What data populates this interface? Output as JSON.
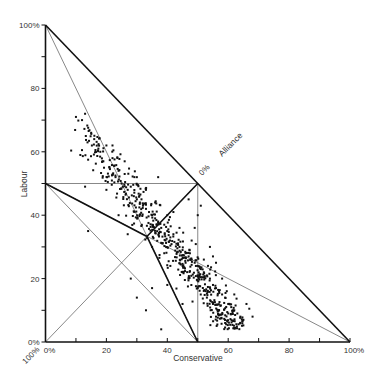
{
  "chart_data": {
    "type": "scatter",
    "subtype": "ternary-in-right-triangle",
    "title": "",
    "xlabel": "Conservative",
    "ylabel": "Labour",
    "third_axis_label": "Alliance",
    "third_axis_zero_label": "0%",
    "xlim": [
      0,
      100
    ],
    "ylim": [
      0,
      100
    ],
    "x_ticks": [
      0,
      10,
      20,
      30,
      40,
      50,
      60,
      70,
      80,
      90,
      100
    ],
    "x_tick_labels": [
      {
        "value": 0,
        "label": "0%"
      },
      {
        "value": 20,
        "label": "20"
      },
      {
        "value": 40,
        "label": "40"
      },
      {
        "value": 60,
        "label": "60"
      },
      {
        "value": 80,
        "label": "80"
      },
      {
        "value": 100,
        "label": "100%"
      }
    ],
    "y_ticks": [
      0,
      10,
      20,
      30,
      40,
      50,
      60,
      70,
      80,
      90,
      100
    ],
    "y_tick_labels": [
      {
        "value": 0,
        "label": "0%"
      },
      {
        "value": 20,
        "label": "20"
      },
      {
        "value": 40,
        "label": "40"
      },
      {
        "value": 60,
        "label": "60"
      },
      {
        "value": 80,
        "label": "80"
      },
      {
        "value": 100,
        "label": "100%"
      }
    ],
    "corner_label_alliance_100": "100%",
    "grid": false,
    "legend": "none",
    "thick_lines": [
      {
        "from": [
          0,
          100
        ],
        "to": [
          100,
          0
        ]
      },
      {
        "from": [
          0,
          50
        ],
        "to": [
          33.3,
          33.3
        ]
      },
      {
        "from": [
          50,
          0
        ],
        "to": [
          33.3,
          33.3
        ]
      },
      {
        "from": [
          50,
          50
        ],
        "to": [
          33.3,
          33.3
        ]
      }
    ],
    "thin_lines": [
      {
        "from": [
          0,
          100
        ],
        "to": [
          50,
          0
        ]
      },
      {
        "from": [
          100,
          0
        ],
        "to": [
          0,
          50
        ]
      },
      {
        "from": [
          0,
          0
        ],
        "to": [
          50,
          50
        ]
      },
      {
        "from": [
          0,
          50
        ],
        "to": [
          50,
          0
        ]
      },
      {
        "from": [
          0,
          50
        ],
        "to": [
          50,
          50
        ]
      },
      {
        "from": [
          50,
          0
        ],
        "to": [
          50,
          50
        ]
      }
    ],
    "series": [
      {
        "name": "Constituencies",
        "description": "Dense band of points running from about (10,72) down to (65,6), concentrated along the line Labour ≈ 80 − 1.2·Conservative",
        "points": [
          [
            10,
            71
          ],
          [
            12,
            70
          ],
          [
            13,
            72
          ],
          [
            15,
            66
          ],
          [
            16,
            64
          ],
          [
            18,
            60
          ],
          [
            19,
            57
          ],
          [
            20,
            62
          ],
          [
            21,
            55
          ],
          [
            22,
            58
          ],
          [
            23,
            52
          ],
          [
            24,
            54
          ],
          [
            25,
            50
          ],
          [
            26,
            53
          ],
          [
            27,
            48
          ],
          [
            28,
            49
          ],
          [
            29,
            46
          ],
          [
            30,
            45
          ],
          [
            31,
            44
          ],
          [
            32,
            43
          ],
          [
            33,
            42
          ],
          [
            34,
            41
          ],
          [
            35,
            40
          ],
          [
            36,
            39
          ],
          [
            37,
            38
          ],
          [
            38,
            36
          ],
          [
            39,
            37
          ],
          [
            40,
            35
          ],
          [
            41,
            33
          ],
          [
            42,
            34
          ],
          [
            43,
            31
          ],
          [
            44,
            30
          ],
          [
            45,
            29
          ],
          [
            46,
            28
          ],
          [
            47,
            27
          ],
          [
            48,
            26
          ],
          [
            49,
            25
          ],
          [
            50,
            24
          ],
          [
            51,
            23
          ],
          [
            52,
            22
          ],
          [
            53,
            21
          ],
          [
            54,
            20
          ],
          [
            55,
            18
          ],
          [
            56,
            17
          ],
          [
            57,
            16
          ],
          [
            58,
            15
          ],
          [
            59,
            14
          ],
          [
            60,
            12
          ],
          [
            61,
            11
          ],
          [
            62,
            10
          ],
          [
            63,
            9
          ],
          [
            64,
            8
          ],
          [
            65,
            7
          ],
          [
            55,
            12
          ],
          [
            57,
            10
          ],
          [
            60,
            9
          ],
          [
            58,
            20
          ],
          [
            52,
            26
          ],
          [
            48,
            32
          ],
          [
            44,
            36
          ],
          [
            40,
            40
          ],
          [
            36,
            44
          ],
          [
            33,
            48
          ],
          [
            30,
            52
          ],
          [
            26,
            57
          ],
          [
            22,
            62
          ],
          [
            45,
            22
          ],
          [
            47,
            20
          ],
          [
            50,
            17
          ],
          [
            53,
            14
          ],
          [
            56,
            8
          ],
          [
            59,
            6
          ],
          [
            20,
            48
          ],
          [
            14,
            35
          ],
          [
            28,
            20
          ],
          [
            30,
            14
          ],
          [
            35,
            17
          ],
          [
            33,
            10
          ],
          [
            38,
            4
          ],
          [
            40,
            18
          ],
          [
            45,
            12
          ],
          [
            46,
            25
          ],
          [
            39,
            28
          ],
          [
            41,
            24
          ],
          [
            35,
            30
          ],
          [
            27,
            34
          ],
          [
            24,
            40
          ],
          [
            62,
            15
          ],
          [
            66,
            12
          ],
          [
            68,
            8
          ],
          [
            55,
            27
          ],
          [
            50,
            40
          ],
          [
            47,
            45
          ],
          [
            51,
            43
          ],
          [
            13,
            49
          ],
          [
            37,
            52
          ],
          [
            42,
            41
          ],
          [
            49,
            36
          ],
          [
            54,
            30
          ],
          [
            56,
            25
          ]
        ],
        "marker": "square",
        "marker_size": 2,
        "color": "#111111",
        "synthetic_fill_count": 520
      }
    ]
  },
  "colors": {
    "ink": "#111111",
    "thin_line": "#555555",
    "label": "#333333",
    "background": "#ffffff"
  }
}
